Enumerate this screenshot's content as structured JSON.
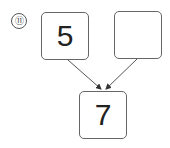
{
  "problem": {
    "number_label": "⑪",
    "boxes": [
      {
        "id": "top-left",
        "value": "5"
      },
      {
        "id": "top-right",
        "value": ""
      },
      {
        "id": "bottom",
        "value": "7"
      }
    ],
    "arrows": [
      {
        "from": "top-left",
        "to": "bottom"
      },
      {
        "from": "top-right",
        "to": "bottom"
      }
    ]
  }
}
